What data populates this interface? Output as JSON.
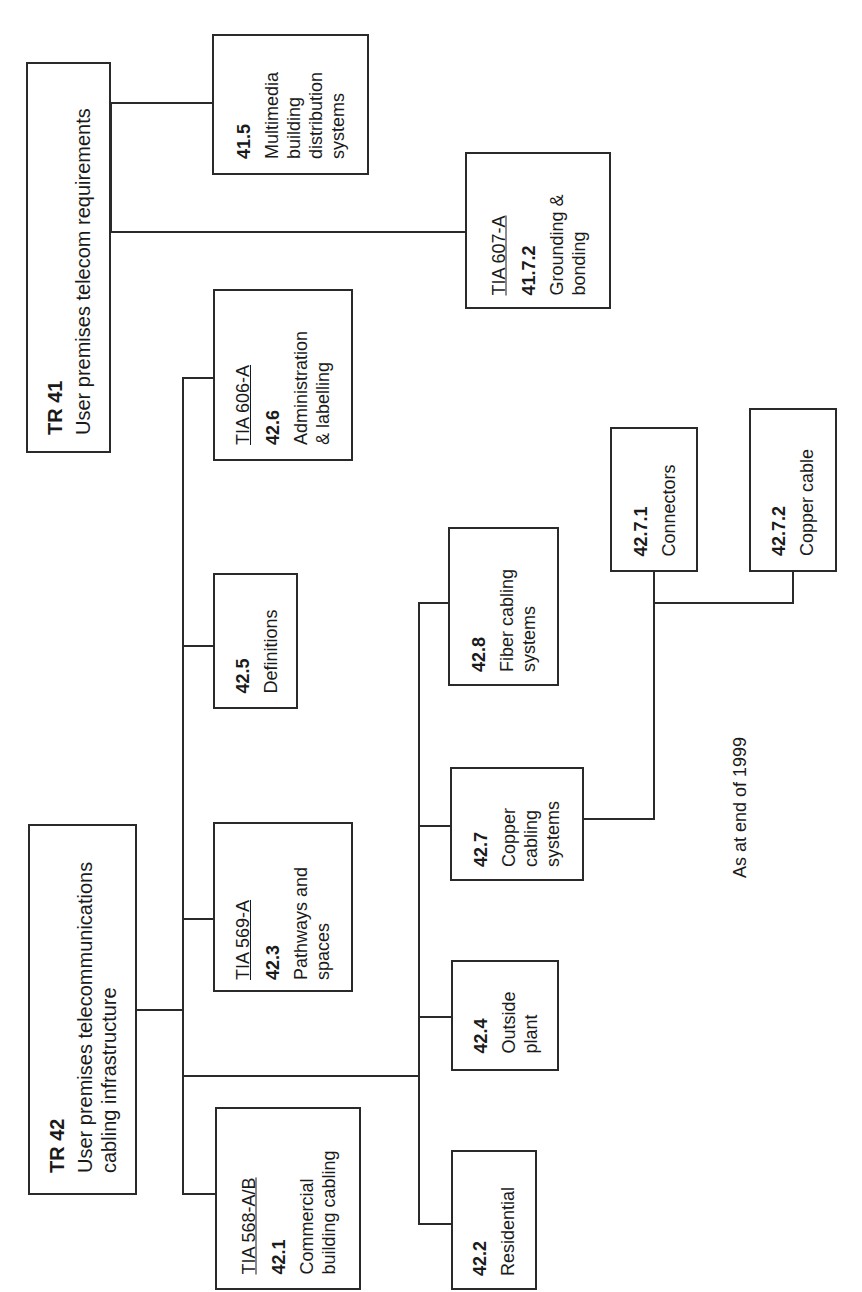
{
  "diagram": {
    "title_fragment": "",
    "note": "As at end of 1999",
    "nodes": {
      "tr41": {
        "number": "TR 41",
        "label": "User premises telecom requirements"
      },
      "n41_5": {
        "number": "41.5",
        "label": "Multimedia\nbuilding\ndistribution\nsystems"
      },
      "n41_7_2": {
        "standard": "TIA 607-A",
        "number": "41.7.2",
        "label": "Grounding &\nbonding"
      },
      "n42_6": {
        "standard": "TIA 606-A",
        "number": "42.6",
        "label": "Administration\n& labelling"
      },
      "n42_5": {
        "number": "42.5",
        "label": "Definitions"
      },
      "n42_3": {
        "standard": "TIA 569-A",
        "number": "42.3",
        "label": "Pathways and\nspaces"
      },
      "tr42": {
        "number": "TR 42",
        "label": "User premises telecommunications\ncabling infrastructure"
      },
      "n42_1": {
        "standard": "TIA 568-A/B",
        "number": "42.1",
        "label": "Commercial\nbuilding cabling"
      },
      "n42_2": {
        "number": "42.2",
        "label": "Residential"
      },
      "n42_4": {
        "number": "42.4",
        "label": "Outside\nplant"
      },
      "n42_7": {
        "number": "42.7",
        "label": "Copper\ncabling\nsystems"
      },
      "n42_8": {
        "number": "42.8",
        "label": "Fiber cabling\nsystems"
      },
      "n42_7_1": {
        "number": "42.7.1",
        "label": "Connectors"
      },
      "n42_7_2": {
        "number": "42.7.2",
        "label": "Copper cable"
      }
    },
    "edges": [
      [
        "tr41",
        "n41_5"
      ],
      [
        "tr41",
        "n41_7_2"
      ],
      [
        "tr42",
        "n42_6"
      ],
      [
        "tr42",
        "n42_5"
      ],
      [
        "tr42",
        "n42_3"
      ],
      [
        "tr42",
        "n42_1"
      ],
      [
        "tr42",
        "n42_8"
      ],
      [
        "tr42",
        "n42_7"
      ],
      [
        "tr42",
        "n42_4"
      ],
      [
        "tr42",
        "n42_2"
      ],
      [
        "n42_7",
        "n42_7_1"
      ],
      [
        "n42_7",
        "n42_7_2"
      ]
    ],
    "colors": {
      "line": "#2a2a2a",
      "background": "#ffffff",
      "text": "#1a1a1a"
    }
  }
}
